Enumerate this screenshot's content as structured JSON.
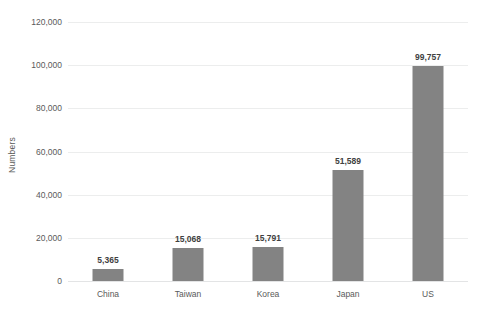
{
  "chart_data": {
    "type": "bar",
    "title": "",
    "subtitle": "",
    "xlabel": "",
    "ylabel": "Numbers",
    "categories": [
      "China",
      "Taiwan",
      "Korea",
      "Japan",
      "US"
    ],
    "values": [
      5365,
      15068,
      15791,
      51589,
      99757
    ],
    "data_labels": [
      "5,365",
      "15,068",
      "15,791",
      "51,589",
      "99,757"
    ],
    "ylim": [
      0,
      120000
    ],
    "ytick_values": [
      0,
      20000,
      40000,
      60000,
      80000,
      100000,
      120000
    ],
    "ytick_labels": [
      "0",
      "20,000",
      "40,000",
      "60,000",
      "80,000",
      "100,000",
      "120,000"
    ],
    "grid": true,
    "grid_axis": "y",
    "legend": false,
    "legend_position": "none",
    "series": [
      {
        "name": "Numbers",
        "color": "#838383",
        "values": [
          5365,
          15068,
          15791,
          51589,
          99757
        ]
      }
    ],
    "colors": {
      "bar": "#838383",
      "gridline": "#eceded",
      "axis_text": "#5a5a5a",
      "label_text": "#404040",
      "background": "#ffffff"
    }
  }
}
